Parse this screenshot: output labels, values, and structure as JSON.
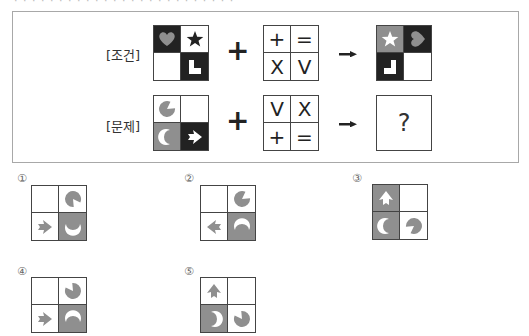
{
  "top_cut_text": "· · · · · · · · · · · · · · · · · · · · · · · · ·",
  "colors": {
    "black": "#222222",
    "gray": "#8f8f8f",
    "white": "#ffffff",
    "shape_gray": "#8f8f8f"
  },
  "condition": {
    "label": "[조건]",
    "input_grid": [
      {
        "bg": "black",
        "shape": "heart",
        "color": "gray",
        "rot": 0
      },
      {
        "bg": "white",
        "shape": "star",
        "color": "black",
        "rot": 0
      },
      {
        "bg": "white",
        "shape": "none",
        "color": "",
        "rot": 0
      },
      {
        "bg": "black",
        "shape": "L",
        "color": "white",
        "rot": 0
      }
    ],
    "operator": "+",
    "rule_grid": [
      "+",
      "=",
      "X",
      "V"
    ],
    "arrow": "→",
    "result_grid": [
      {
        "bg": "gray",
        "shape": "star",
        "color": "white",
        "rot": 0
      },
      {
        "bg": "black",
        "shape": "heart",
        "color": "gray",
        "rot": -90
      },
      {
        "bg": "black",
        "shape": "L",
        "color": "white",
        "rot": 180,
        "flip": true
      },
      {
        "bg": "white",
        "shape": "none",
        "color": "",
        "rot": 0
      }
    ]
  },
  "problem": {
    "label": "[문제]",
    "input_grid": [
      {
        "bg": "white",
        "shape": "pacman",
        "color": "gray",
        "rot": 0
      },
      {
        "bg": "white",
        "shape": "none",
        "color": "",
        "rot": 0
      },
      {
        "bg": "gray",
        "shape": "crescent",
        "color": "white",
        "rot": 0
      },
      {
        "bg": "black",
        "shape": "arrow",
        "color": "white",
        "rot": 0
      }
    ],
    "operator": "+",
    "rule_grid": [
      "V",
      "X",
      "+",
      "="
    ],
    "arrow": "→",
    "answer_placeholder": "?"
  },
  "options": [
    {
      "number": "①",
      "grid": [
        {
          "bg": "white",
          "shape": "none",
          "color": "",
          "rot": 0
        },
        {
          "bg": "white",
          "shape": "pacman",
          "color": "gray",
          "rot": 90
        },
        {
          "bg": "white",
          "shape": "arrow",
          "color": "gray",
          "rot": 0
        },
        {
          "bg": "gray",
          "shape": "crescent",
          "color": "white",
          "rot": -90
        }
      ]
    },
    {
      "number": "②",
      "grid": [
        {
          "bg": "white",
          "shape": "none",
          "color": "",
          "rot": 0
        },
        {
          "bg": "white",
          "shape": "pacman",
          "color": "gray",
          "rot": 0
        },
        {
          "bg": "white",
          "shape": "arrow",
          "color": "gray",
          "rot": 180
        },
        {
          "bg": "gray",
          "shape": "crescent",
          "color": "white",
          "rot": 90
        }
      ]
    },
    {
      "number": "③",
      "grid": [
        {
          "bg": "gray",
          "shape": "arrow",
          "color": "white",
          "rot": -90
        },
        {
          "bg": "white",
          "shape": "none",
          "color": "",
          "rot": 0
        },
        {
          "bg": "gray",
          "shape": "crescent",
          "color": "white",
          "rot": 0
        },
        {
          "bg": "white",
          "shape": "pacman",
          "color": "gray",
          "rot": 180
        }
      ]
    },
    {
      "number": "④",
      "grid": [
        {
          "bg": "white",
          "shape": "none",
          "color": "",
          "rot": 0
        },
        {
          "bg": "white",
          "shape": "pacman",
          "color": "gray",
          "rot": -90
        },
        {
          "bg": "white",
          "shape": "arrow",
          "color": "gray",
          "rot": 0
        },
        {
          "bg": "gray",
          "shape": "crescent",
          "color": "white",
          "rot": 90
        }
      ]
    },
    {
      "number": "⑤",
      "grid": [
        {
          "bg": "white",
          "shape": "arrow",
          "color": "gray",
          "rot": -90
        },
        {
          "bg": "white",
          "shape": "none",
          "color": "",
          "rot": 0
        },
        {
          "bg": "gray",
          "shape": "crescent",
          "color": "white",
          "rot": 180
        },
        {
          "bg": "white",
          "shape": "pacman",
          "color": "gray",
          "rot": -90
        }
      ]
    }
  ]
}
